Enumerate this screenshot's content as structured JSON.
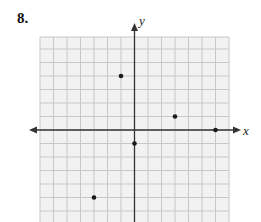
{
  "problem": {
    "number": "8."
  },
  "chart_data": {
    "type": "scatter",
    "title": "",
    "xlabel": "x",
    "ylabel": "y",
    "xlim": [
      -7,
      7
    ],
    "ylim": [
      -7,
      7
    ],
    "grid": true,
    "tick_labels": false,
    "points": [
      {
        "x": -1,
        "y": 4
      },
      {
        "x": 3,
        "y": 1
      },
      {
        "x": 6,
        "y": 0
      },
      {
        "x": 0,
        "y": -1
      },
      {
        "x": -3,
        "y": -5
      }
    ]
  },
  "style": {
    "grid_color": "#c8c8c8",
    "grid_bg": "#f2f2f2",
    "axis_color": "#333333",
    "point_color": "#1a1a1a"
  }
}
